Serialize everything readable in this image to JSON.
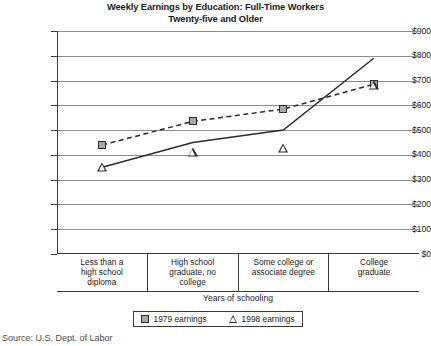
{
  "chart_data": {
    "type": "line",
    "title": "Weekly Earnings by Education: Full-Time Workers Twenty-five and Older",
    "title_line1": "Weekly Earnings by Education: Full-Time Workers",
    "title_line2": "Twenty-five and Older",
    "xlabel": "Years of schooling",
    "ylabel": "Earnings",
    "ylim": [
      0,
      900
    ],
    "grid": true,
    "legend_position": "below-plot",
    "categories": [
      "Less than a high school diploma",
      "High school graduate, no college",
      "Some college or associate degree",
      "College graduate"
    ],
    "category_lines": [
      [
        "Less than a",
        "high school",
        "diploma"
      ],
      [
        "High school",
        "graduate, no",
        "college"
      ],
      [
        "Some college or",
        "associate degree"
      ],
      [
        "College",
        "graduate"
      ]
    ],
    "ytick_labels": [
      "$900",
      "$800",
      "$700",
      "$600",
      "$500",
      "$400",
      "$300",
      "$200",
      "$100",
      "$0"
    ],
    "ytick_values": [
      900,
      800,
      700,
      600,
      500,
      400,
      300,
      200,
      100,
      0
    ],
    "series": [
      {
        "name": "1979 earnings",
        "marker": "square",
        "line_style": "dashed",
        "color": "#2b2b2b",
        "marker_fill": "#a8a8a8",
        "values": [
          440,
          535,
          585,
          685
        ]
      },
      {
        "name": "1998 earnings",
        "marker": "triangle",
        "line_style": "solid",
        "color": "#2b2b2b",
        "marker_fill": "#ffffff",
        "values": [
          350,
          450,
          500,
          790
        ]
      }
    ]
  },
  "legend": {
    "entries": [
      {
        "label": "1979 earnings"
      },
      {
        "label": "1998 earnings"
      }
    ]
  },
  "source": {
    "text": "Source: U.S. Dept. of Labor"
  }
}
